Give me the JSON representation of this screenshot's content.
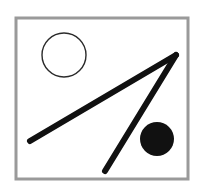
{
  "figure": {
    "canvas": {
      "width": 202,
      "height": 184,
      "background": "#ffffff"
    },
    "frame": {
      "name": "rectangular border frame",
      "x": 16,
      "y": 18,
      "width": 172,
      "height": 161,
      "stroke": "#9a9a9a",
      "stroke_width": 3,
      "fill": "#ffffff"
    },
    "shapes": [
      {
        "id": "open-circle",
        "kind": "circle",
        "style": "outline",
        "cx": 64,
        "cy": 55,
        "r": 22,
        "stroke": "#2b2b2b",
        "stroke_width": 1.4,
        "fill": "none"
      },
      {
        "id": "filled-circle",
        "kind": "circle",
        "style": "filled",
        "cx": 157,
        "cy": 139,
        "r": 17,
        "stroke": "none",
        "stroke_width": 0,
        "fill": "#111111"
      },
      {
        "id": "long-shallow-line",
        "kind": "line",
        "x1": 30,
        "y1": 141,
        "x2": 176,
        "y2": 55,
        "stroke": "#111111",
        "stroke_width": 6
      },
      {
        "id": "short-steep-line",
        "kind": "line",
        "x1": 105,
        "y1": 171,
        "x2": 176,
        "y2": 55,
        "stroke": "#111111",
        "stroke_width": 6
      }
    ],
    "vertex": {
      "id": "apex",
      "x": 176,
      "y": 55
    },
    "colors": {
      "ink": "#111111",
      "outline_ink": "#2b2b2b",
      "frame": "#9a9a9a",
      "paper": "#ffffff"
    }
  }
}
